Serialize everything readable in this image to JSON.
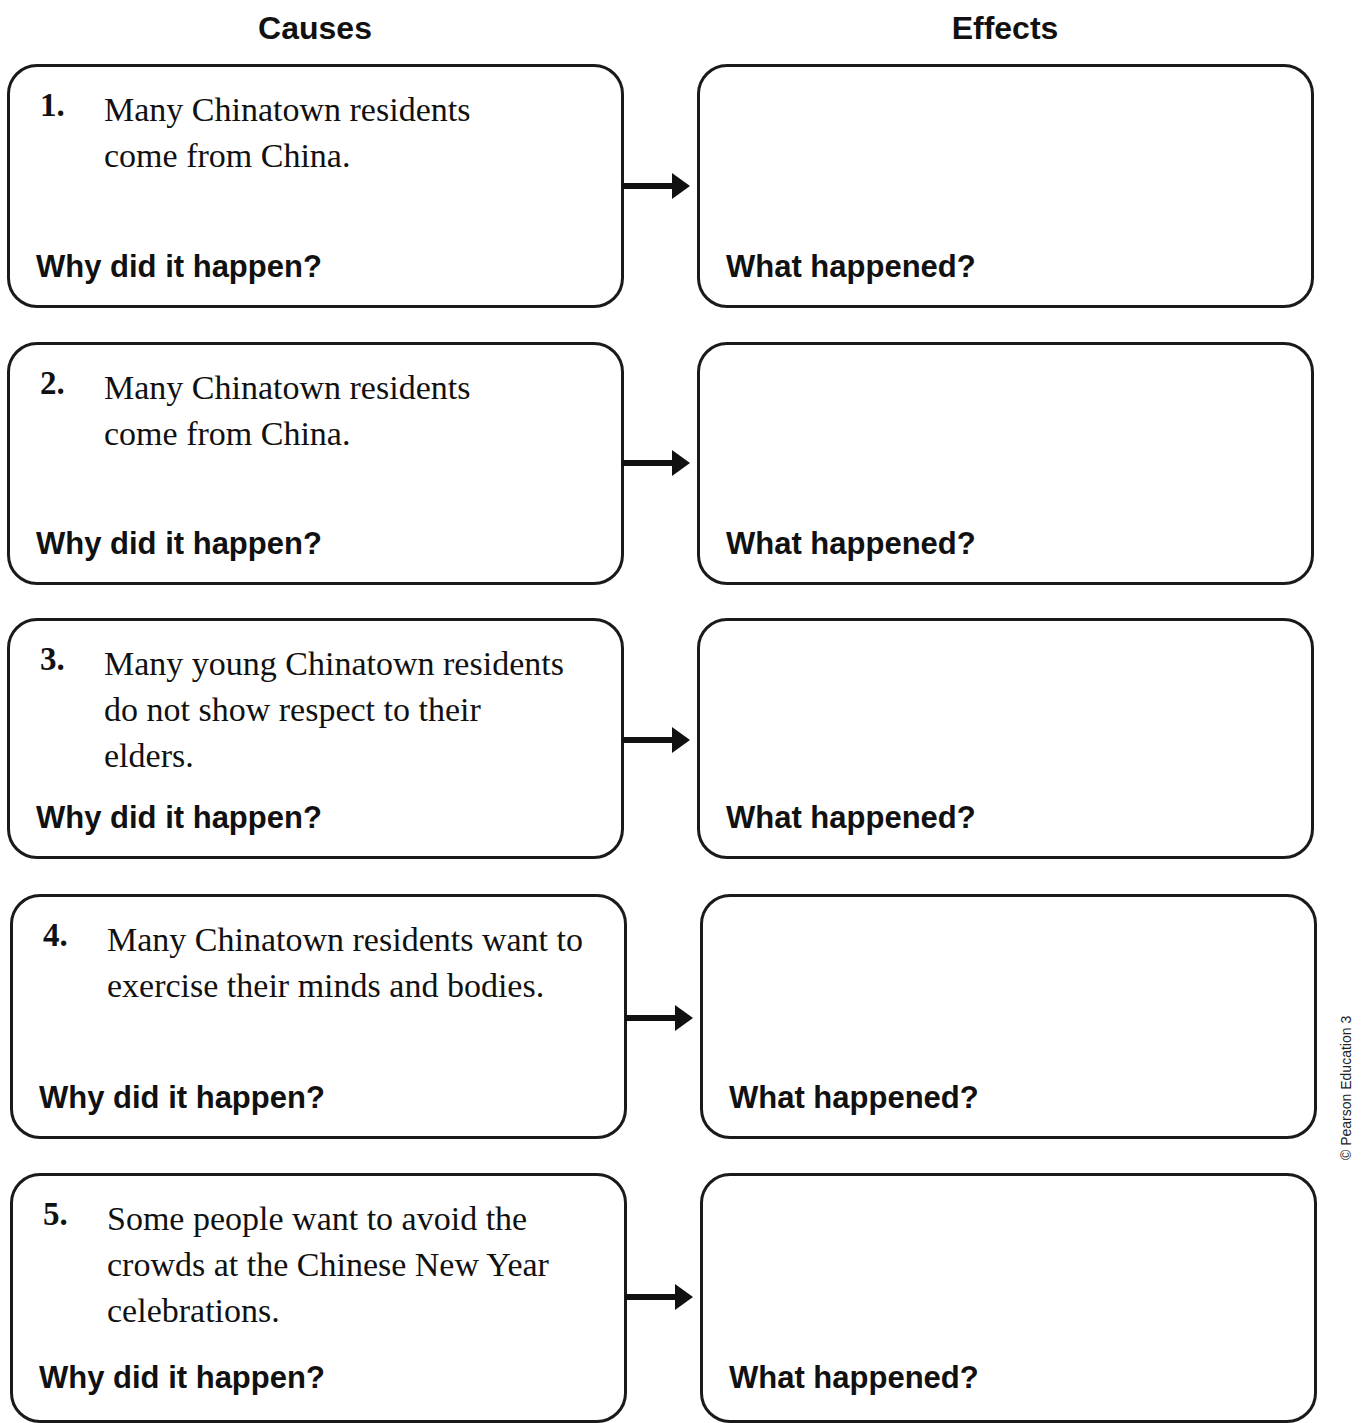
{
  "header": {
    "causes_label": "Causes",
    "effects_label": "Effects"
  },
  "rows": [
    {
      "number": "1.",
      "cause_text": "Many Chinatown residents come from China.",
      "cause_prompt": "Why did it happen?",
      "effect_text": "",
      "effect_prompt": "What happened?"
    },
    {
      "number": "2.",
      "cause_text": "Many Chinatown residents come from China.",
      "cause_prompt": "Why did it happen?",
      "effect_text": "",
      "effect_prompt": "What happened?"
    },
    {
      "number": "3.",
      "cause_text": "Many young Chinatown residents do not show respect to their elders.",
      "cause_prompt": "Why did it happen?",
      "effect_text": "",
      "effect_prompt": "What happened?"
    },
    {
      "number": "4.",
      "cause_text": "Many Chinatown residents want to exercise their minds and bodies.",
      "cause_prompt": "Why did it happen?",
      "effect_text": "",
      "effect_prompt": "What happened?"
    },
    {
      "number": "5.",
      "cause_text": "Some people want to avoid the crowds at the Chinese New Year celebrations.",
      "cause_prompt": "Why did it happen?",
      "effect_text": "",
      "effect_prompt": "What happened?"
    }
  ],
  "footer": {
    "copyright": "© Pearson Education 3"
  },
  "colors": {
    "ink": "#111111",
    "border": "#1a1a1a",
    "background": "#ffffff"
  }
}
